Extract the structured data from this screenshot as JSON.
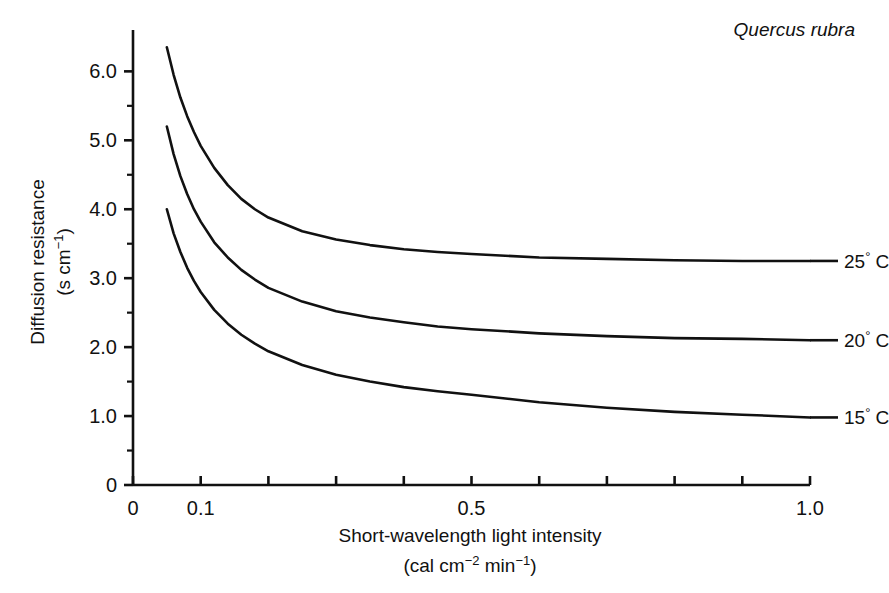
{
  "figure": {
    "species_annotation": "Quercus rubra",
    "background_color": "#ffffff",
    "line_color": "#111111"
  },
  "axes": {
    "y_title_line1": "Diffusion resistance",
    "y_title_line2_prefix": "(s cm",
    "y_title_line2_sup": "−1",
    "y_title_line2_suffix": ")",
    "x_title_line1": "Short-wavelength light intensity",
    "x_title_line2_prefix": "(cal cm",
    "x_title_line2_sup1": "−2",
    "x_title_line2_mid": " min",
    "x_title_line2_sup2": "−1",
    "x_title_line2_suffix": ")",
    "y_tick_labels": [
      "0",
      "1.0",
      "2.0",
      "3.0",
      "4.0",
      "5.0",
      "6.0"
    ],
    "x_tick_labels": [
      "0",
      "0.1",
      "0.5",
      "1.0"
    ],
    "origin_label": "0"
  },
  "series_labels": [
    {
      "value": "25",
      "degree": "°",
      "unit": "C"
    },
    {
      "value": "20",
      "degree": "°",
      "unit": "C"
    },
    {
      "value": "15",
      "degree": "°",
      "unit": "C"
    }
  ],
  "chart_data": {
    "type": "line",
    "title": "",
    "subtitle": "",
    "annotations": [
      "Quercus rubra"
    ],
    "xlabel": "Short-wavelength light intensity (cal cm^-2 min^-1)",
    "ylabel": "Diffusion resistance (s cm^-1)",
    "xlim": [
      0,
      1.0
    ],
    "ylim": [
      0,
      6.6
    ],
    "x_ticks_major_labeled": [
      0,
      0.1,
      0.5,
      1.0
    ],
    "x_ticks_all": [
      0,
      0.1,
      0.2,
      0.3,
      0.4,
      0.5,
      0.6,
      0.7,
      0.8,
      0.9,
      1.0
    ],
    "y_ticks": [
      0,
      1.0,
      2.0,
      3.0,
      4.0,
      5.0,
      6.0
    ],
    "grid": false,
    "legend_position": "right-of-curve-ends",
    "x": [
      0.05,
      0.06,
      0.07,
      0.08,
      0.09,
      0.1,
      0.12,
      0.14,
      0.16,
      0.18,
      0.2,
      0.25,
      0.3,
      0.35,
      0.4,
      0.45,
      0.5,
      0.6,
      0.7,
      0.8,
      0.9,
      1.0
    ],
    "series": [
      {
        "name": "25° C",
        "values": [
          6.35,
          5.95,
          5.62,
          5.35,
          5.12,
          4.92,
          4.6,
          4.35,
          4.15,
          4.0,
          3.88,
          3.68,
          3.56,
          3.48,
          3.42,
          3.38,
          3.35,
          3.3,
          3.28,
          3.26,
          3.25,
          3.25
        ]
      },
      {
        "name": "20° C",
        "values": [
          5.2,
          4.8,
          4.48,
          4.22,
          4.0,
          3.82,
          3.52,
          3.3,
          3.12,
          2.98,
          2.86,
          2.66,
          2.52,
          2.43,
          2.36,
          2.3,
          2.26,
          2.2,
          2.16,
          2.13,
          2.12,
          2.1
        ]
      },
      {
        "name": "15° C",
        "values": [
          4.0,
          3.65,
          3.38,
          3.15,
          2.96,
          2.8,
          2.54,
          2.34,
          2.18,
          2.05,
          1.94,
          1.74,
          1.6,
          1.5,
          1.42,
          1.36,
          1.31,
          1.2,
          1.12,
          1.06,
          1.02,
          0.98
        ]
      }
    ]
  }
}
